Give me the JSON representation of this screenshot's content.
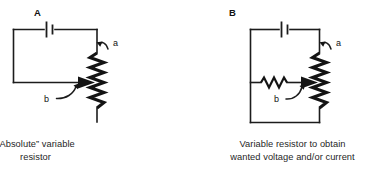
{
  "figure": {
    "background_color": "#ffffff",
    "ink_color": "#1a1a1a",
    "width": 390,
    "height": 183
  },
  "panels": [
    {
      "id": "A",
      "title": "A",
      "caption_lines": [
        "“Absolute” variable",
        "resistor"
      ],
      "caption_text": "“Absolute” variable resistor",
      "labels": {
        "terminal_a": "a",
        "terminal_b": "b"
      },
      "components": [
        {
          "name": "battery",
          "symbol": "dc-source"
        },
        {
          "name": "variable-resistor",
          "symbol": "zigzag-resistor"
        },
        {
          "name": "wiper",
          "symbol": "arrow-tap"
        }
      ]
    },
    {
      "id": "B",
      "title": "B",
      "caption_lines": [
        "Variable resistor to obtain",
        "wanted voltage and/or current"
      ],
      "caption_text": "Variable resistor to obtain wanted voltage and/or current",
      "labels": {
        "terminal_a": "a",
        "terminal_b": "b"
      },
      "components": [
        {
          "name": "battery",
          "symbol": "dc-source"
        },
        {
          "name": "variable-resistor",
          "symbol": "zigzag-resistor"
        },
        {
          "name": "load-resistor",
          "symbol": "zigzag-resistor-small"
        },
        {
          "name": "wiper",
          "symbol": "arrow-tap"
        }
      ]
    }
  ]
}
